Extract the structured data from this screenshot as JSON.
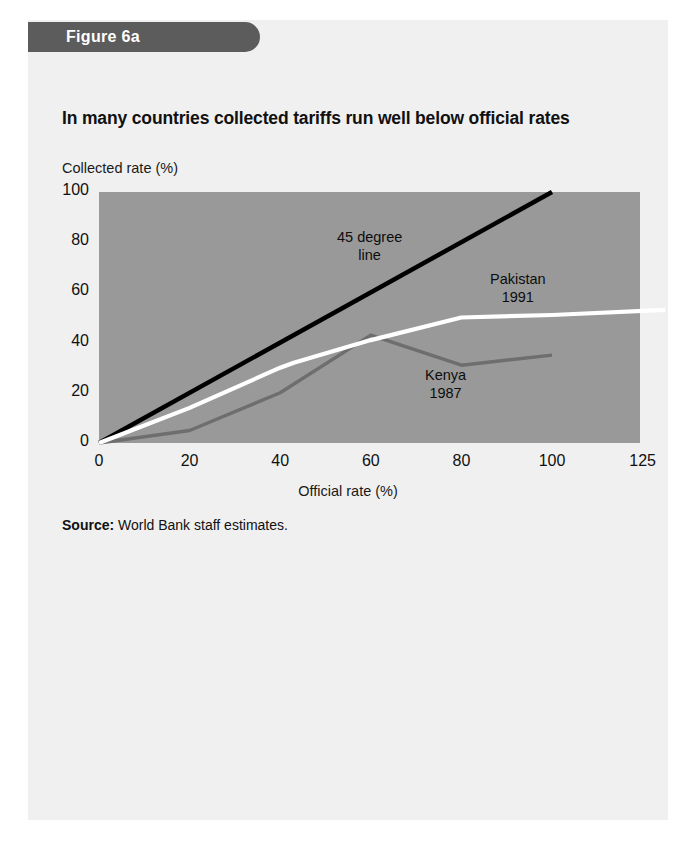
{
  "banner": {
    "label": "Figure 6a"
  },
  "chart_title": "In many countries collected tariffs run well below official rates",
  "source": {
    "strong": "Source:",
    "text": " World Bank staff estimates."
  },
  "colors": {
    "page_background": "#f0f0f0",
    "banner": "#5c5c5c",
    "plot_background": "#999999",
    "line_45": "#000000",
    "line_pakistan": "#ffffff",
    "line_kenya": "#6e6e6e"
  },
  "annotations": {
    "line45": {
      "line1": "45 degree",
      "line2": "line"
    },
    "pakistan": {
      "line1": "Pakistan",
      "line2": "1991"
    },
    "kenya": {
      "line1": "Kenya",
      "line2": "1987"
    }
  },
  "chart_data": {
    "type": "line",
    "title": "In many countries collected tariffs run well below official rates",
    "xlabel": "Official rate (%)",
    "ylabel": "Collected rate (%)",
    "xlim": [
      0,
      125
    ],
    "ylim": [
      0,
      100
    ],
    "grid": false,
    "legend": "inline-annotations",
    "xticks": [
      "0",
      "20",
      "40",
      "60",
      "80",
      "100",
      "125"
    ],
    "yticks": [
      "0",
      "20",
      "40",
      "60",
      "80",
      "100"
    ],
    "series": [
      {
        "name": "45 degree line",
        "color": "#000000",
        "x": [
          0,
          100
        ],
        "y": [
          0,
          100
        ]
      },
      {
        "name": "Pakistan 1991",
        "color": "#ffffff",
        "x": [
          0,
          20,
          40,
          43,
          60,
          80,
          100,
          125
        ],
        "y": [
          0,
          14,
          30,
          32,
          41,
          50,
          51,
          53
        ]
      },
      {
        "name": "Kenya 1987",
        "color": "#6e6e6e",
        "x": [
          0,
          20,
          40,
          60,
          80,
          100
        ],
        "y": [
          0,
          5,
          20,
          43,
          31,
          35
        ]
      }
    ]
  }
}
